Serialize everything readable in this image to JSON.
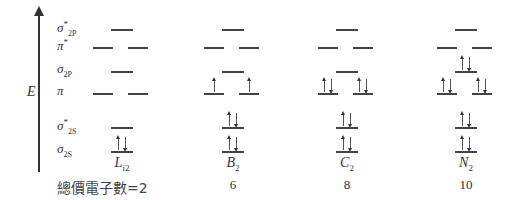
{
  "axis": {
    "label": "E"
  },
  "orbitals": [
    {
      "id": "sigma_star_2p",
      "symbol": "σ",
      "sub": "2P",
      "sup": "*",
      "y": 29,
      "degenerate": false
    },
    {
      "id": "pi_star",
      "symbol": "π",
      "sub": "",
      "sup": "*",
      "y": 47,
      "degenerate": true
    },
    {
      "id": "sigma_2p",
      "symbol": "σ",
      "sub": "2P",
      "sup": "",
      "y": 71,
      "degenerate": false
    },
    {
      "id": "pi",
      "symbol": "π",
      "sub": "",
      "sup": "",
      "y": 93,
      "degenerate": true
    },
    {
      "id": "sigma_star_2s",
      "symbol": "σ",
      "sub": "2S",
      "sup": "*",
      "y": 127,
      "degenerate": false
    },
    {
      "id": "sigma_2s",
      "symbol": "σ",
      "sub": "2S",
      "sup": "",
      "y": 151,
      "degenerate": false
    }
  ],
  "molecules": [
    {
      "name": "L",
      "sub": "i2",
      "center": 122,
      "valence": "2",
      "occupancy": {
        "sigma_2s": [
          2
        ],
        "sigma_star_2s": [
          0
        ],
        "pi": [
          0,
          0
        ],
        "sigma_2p": [
          0
        ],
        "pi_star": [
          0,
          0
        ],
        "sigma_star_2p": [
          0
        ]
      }
    },
    {
      "name": "B",
      "sub": "2",
      "center": 233,
      "valence": "6",
      "occupancy": {
        "sigma_2s": [
          2
        ],
        "sigma_star_2s": [
          2
        ],
        "pi": [
          1,
          1
        ],
        "sigma_2p": [
          0
        ],
        "pi_star": [
          0,
          0
        ],
        "sigma_star_2p": [
          0
        ]
      }
    },
    {
      "name": "C",
      "sub": "2",
      "center": 347,
      "valence": "8",
      "occupancy": {
        "sigma_2s": [
          2
        ],
        "sigma_star_2s": [
          2
        ],
        "pi": [
          2,
          2
        ],
        "sigma_2p": [
          0
        ],
        "pi_star": [
          0,
          0
        ],
        "sigma_star_2p": [
          0
        ]
      }
    },
    {
      "name": "N",
      "sub": "2",
      "center": 466,
      "valence": "10",
      "occupancy": {
        "sigma_2s": [
          2
        ],
        "sigma_star_2s": [
          2
        ],
        "pi": [
          2,
          2
        ],
        "sigma_2p": [
          2
        ],
        "pi_star": [
          0,
          0
        ],
        "sigma_star_2p": [
          0
        ]
      }
    }
  ],
  "footer": {
    "valence_label": "總價電子數=2"
  }
}
